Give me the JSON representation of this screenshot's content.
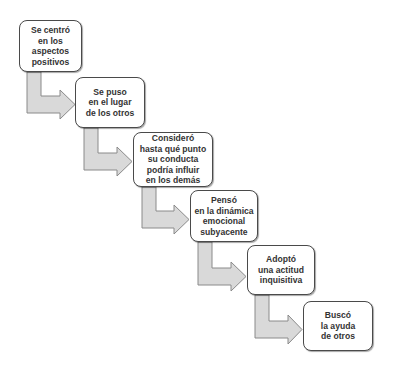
{
  "diagram": {
    "type": "staircase-flow",
    "colors": {
      "box_border": "#4a4a4a",
      "box_fill": "#ffffff",
      "text": "#333333",
      "arrow_fill": "#d9d9d9",
      "arrow_stroke": "#8a8a8a"
    },
    "steps": [
      {
        "label": "Se centró\nen los\naspectos\npositivos"
      },
      {
        "label": "Se puso\nen el lugar\nde los otros"
      },
      {
        "label": "Consideró\nhasta qué punto\nsu conducta\npodría influir\nen los demás"
      },
      {
        "label": "Pensó\nen la dinámica\nemocional\nsubyacente"
      },
      {
        "label": "Adoptó\nuna actitud\ninquisitiva"
      },
      {
        "label": "Buscó\nla ayuda\nde otros"
      }
    ],
    "connectors": [
      {
        "from": 1,
        "to": 2,
        "shape": "bent-arrow"
      },
      {
        "from": 2,
        "to": 3,
        "shape": "bent-arrow"
      },
      {
        "from": 3,
        "to": 4,
        "shape": "bent-arrow"
      },
      {
        "from": 4,
        "to": 5,
        "shape": "bent-arrow"
      },
      {
        "from": 5,
        "to": 6,
        "shape": "bent-arrow"
      }
    ]
  }
}
